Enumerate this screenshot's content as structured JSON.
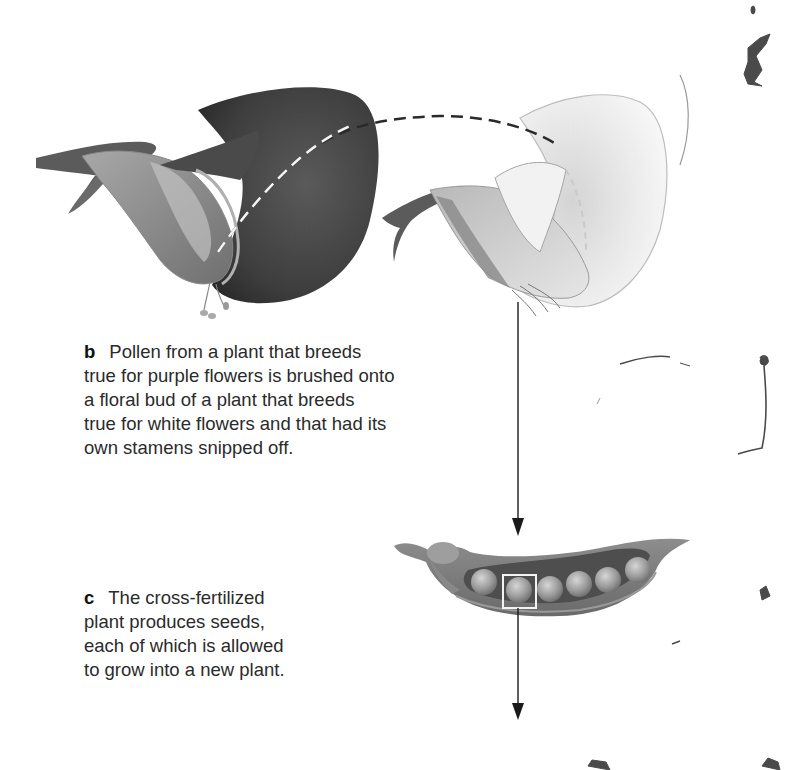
{
  "figure": {
    "colors": {
      "purple_flower_dark": "#3d3d3d",
      "white_flower_light": "#ececec",
      "stem": "#555555",
      "arrow": "#1a1a1a",
      "dashed_path": "#2a2a2a"
    },
    "panels": [
      {
        "letter": "b",
        "lines": [
          "Pollen from a plant that breeds",
          "true for purple flowers is brushed onto",
          "a floral bud of a plant that breeds",
          "true for white flowers and that had its",
          "own stamens snipped off."
        ],
        "illustrations": [
          "purple-flower",
          "white-flower",
          "dashed-pollen-transfer-path"
        ]
      },
      {
        "letter": "c",
        "lines": [
          "The cross-fertilized",
          "plant produces seeds,",
          "each of which is allowed",
          "to grow into a new plant."
        ],
        "illustrations": [
          "pea-pod",
          "selected-seed-box",
          "down-arrow"
        ]
      }
    ],
    "pea_pod": {
      "seed_count": 6,
      "highlighted_seed_index": 1
    }
  }
}
